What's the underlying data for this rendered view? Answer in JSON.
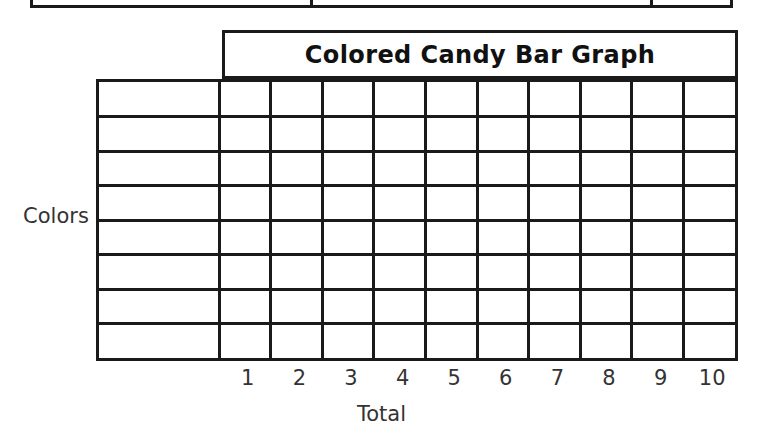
{
  "worksheet": {
    "title": "Colored Candy Bar Graph",
    "y_axis_label": "Colors",
    "x_axis_label": "Total",
    "x_tick_labels": [
      "1",
      "2",
      "3",
      "4",
      "5",
      "6",
      "7",
      "8",
      "9",
      "10"
    ],
    "row_count": 8,
    "column_count": 10,
    "row_labels": [
      "",
      "",
      "",
      "",
      "",
      "",
      "",
      ""
    ],
    "cells": [
      [
        "",
        "",
        "",
        "",
        "",
        "",
        "",
        "",
        "",
        ""
      ],
      [
        "",
        "",
        "",
        "",
        "",
        "",
        "",
        "",
        "",
        ""
      ],
      [
        "",
        "",
        "",
        "",
        "",
        "",
        "",
        "",
        "",
        ""
      ],
      [
        "",
        "",
        "",
        "",
        "",
        "",
        "",
        "",
        "",
        ""
      ],
      [
        "",
        "",
        "",
        "",
        "",
        "",
        "",
        "",
        "",
        ""
      ],
      [
        "",
        "",
        "",
        "",
        "",
        "",
        "",
        "",
        "",
        ""
      ],
      [
        "",
        "",
        "",
        "",
        "",
        "",
        "",
        "",
        "",
        ""
      ],
      [
        "",
        "",
        "",
        "",
        "",
        "",
        "",
        "",
        "",
        ""
      ]
    ],
    "line_color": "#1a1a1a",
    "background_color": "#ffffff",
    "text_color": "#333333"
  },
  "chart_data": {
    "type": "bar",
    "title": "Colored Candy Bar Graph",
    "xlabel": "Total",
    "ylabel": "Colors",
    "orientation": "horizontal",
    "categories": [
      "",
      "",
      "",
      "",
      "",
      "",
      "",
      ""
    ],
    "values": [
      0,
      0,
      0,
      0,
      0,
      0,
      0,
      0
    ],
    "xticks": [
      1,
      2,
      3,
      4,
      5,
      6,
      7,
      8,
      9,
      10
    ],
    "xlim": [
      0,
      10
    ],
    "grid": true,
    "legend": "none",
    "note": "Blank printable tally/bar-graph template; no data plotted."
  },
  "top_table_fragment": {
    "visible": "bottom-border-only",
    "divider_offsets": [
      0,
      280,
      620,
      700
    ]
  }
}
